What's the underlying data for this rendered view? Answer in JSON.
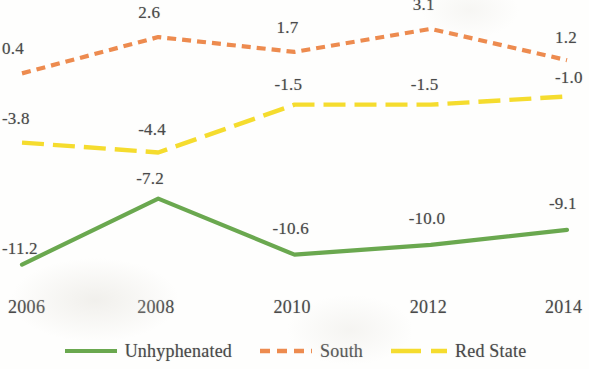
{
  "chart_data": {
    "type": "line",
    "title": "",
    "subtitle": "",
    "xlabel": "",
    "ylabel": "",
    "grid": false,
    "legend_position": "bottom-center",
    "x": [
      2006,
      2008,
      2010,
      2012,
      2014
    ],
    "categories": [
      "2006",
      "2008",
      "2010",
      "2012",
      "2014"
    ],
    "xlim": [
      2006,
      2014
    ],
    "ylim": [
      -12.5,
      4.0
    ],
    "axis_visible": false,
    "series": [
      {
        "name": "Unhyphenated",
        "color": "#6AA84F",
        "dash": "solid",
        "values": [
          -11.2,
          -7.2,
          -10.6,
          -10.0,
          -9.1
        ],
        "labels": [
          "-11.2",
          "-7.2",
          "-10.6",
          "-10.0",
          "-9.1"
        ]
      },
      {
        "name": "South",
        "color": "#ED8B4F",
        "dash": "dashed",
        "values": [
          0.4,
          2.6,
          1.7,
          3.1,
          1.2
        ],
        "labels": [
          "0.4",
          "2.6",
          "1.7",
          "3.1",
          "1.2"
        ]
      },
      {
        "name": "Red State",
        "color": "#F5DC2E",
        "dash": "long-dash-dot",
        "values": [
          -3.8,
          -4.4,
          -1.5,
          -1.5,
          -1.0
        ],
        "labels": [
          "-3.8",
          "-4.4",
          "-1.5",
          "-1.5",
          "-1.0"
        ]
      }
    ]
  },
  "axis": {
    "x_tick_labels": [
      "2006",
      "2008",
      "2010",
      "2012",
      "2014"
    ]
  },
  "legend": {
    "items": [
      {
        "label": "Unhyphenated",
        "color": "#6AA84F",
        "dash": "solid"
      },
      {
        "label": "South",
        "color": "#ED8B4F",
        "dash": "dashed"
      },
      {
        "label": "Red State",
        "color": "#F5DC2E",
        "dash": "long-dash-dot"
      }
    ]
  },
  "point_labels": {
    "unhyphenated": [
      "-11.2",
      "-7.2",
      "-10.6",
      "-10.0",
      "-9.1"
    ],
    "south": [
      "0.4",
      "2.6",
      "1.7",
      "3.1",
      "1.2"
    ],
    "red_state": [
      "-3.8",
      "-4.4",
      "-1.5",
      "-1.5",
      "-1.0"
    ]
  }
}
